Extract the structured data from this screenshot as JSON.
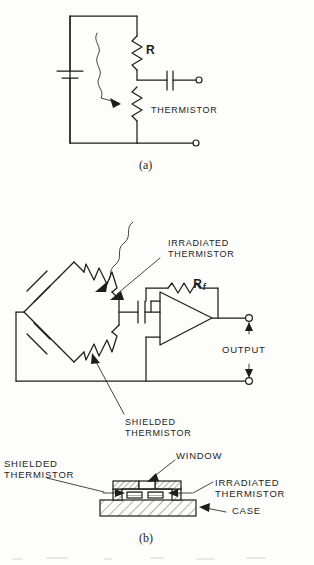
{
  "figure": {
    "ink_color": "#1d1d1d",
    "paper_color": "#fdfdfb"
  },
  "panel_a": {
    "caption": "(a)",
    "labels": {
      "resistor": "R",
      "thermistor": "THERMISTOR"
    },
    "components": [
      {
        "name": "battery",
        "symbol": "battery-cell"
      },
      {
        "name": "resistor-r",
        "symbol": "resistor-zigzag"
      },
      {
        "name": "thermistor",
        "symbol": "resistor-zigzag"
      },
      {
        "name": "coupling-capacitor",
        "symbol": "capacitor-plates"
      },
      {
        "name": "output-terminal-top",
        "symbol": "terminal-circle"
      },
      {
        "name": "output-terminal-bottom",
        "symbol": "terminal-circle"
      },
      {
        "name": "radiation-arrow",
        "symbol": "wavy-arrow"
      }
    ]
  },
  "panel_b": {
    "caption": "(b)",
    "labels": {
      "irradiated_thermistor": "IRRADIATED\nTHERMISTOR",
      "shielded_thermistor": "SHIELDED\nTHERMISTOR",
      "feedback_resistor": "R",
      "feedback_resistor_sub": "f",
      "output": "OUTPUT"
    },
    "components": [
      {
        "name": "bridge-network",
        "symbol": "diamond-bridge"
      },
      {
        "name": "battery-cell-upper",
        "symbol": "battery-cell"
      },
      {
        "name": "battery-cell-lower",
        "symbol": "battery-cell"
      },
      {
        "name": "irradiated-thermistor",
        "symbol": "resistor-zigzag"
      },
      {
        "name": "shielded-thermistor",
        "symbol": "resistor-zigzag"
      },
      {
        "name": "coupling-capacitor",
        "symbol": "capacitor-plates"
      },
      {
        "name": "operational-amplifier",
        "symbol": "amplifier-triangle"
      },
      {
        "name": "feedback-resistor",
        "symbol": "resistor-zigzag"
      },
      {
        "name": "output-terminal-top",
        "symbol": "terminal-circle"
      },
      {
        "name": "output-terminal-bottom",
        "symbol": "terminal-circle"
      },
      {
        "name": "radiation-arrow",
        "symbol": "wavy-arrow"
      }
    ]
  },
  "panel_c": {
    "labels": {
      "window": "WINDOW",
      "shielded_thermistor": "SHIELDED\nTHERMISTOR",
      "irradiated_thermistor": "IRRADIATED\nTHERMISTOR",
      "case": "CASE"
    },
    "components": [
      {
        "name": "case-base",
        "symbol": "hatched-block"
      },
      {
        "name": "case-cover",
        "symbol": "hatched-block"
      },
      {
        "name": "window-pane",
        "symbol": "open-aperture"
      },
      {
        "name": "thermistor-flake-left",
        "symbol": "hatched-element"
      },
      {
        "name": "thermistor-flake-right",
        "symbol": "hatched-element"
      }
    ]
  }
}
